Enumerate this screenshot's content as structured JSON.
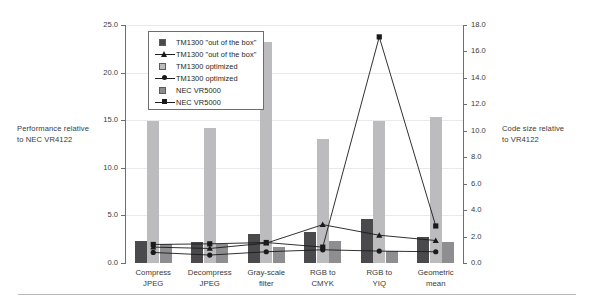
{
  "chart_data": {
    "type": "bar",
    "title": "",
    "subtitle": "",
    "categories": [
      "Compress JPEG",
      "Decompress JPEG",
      "Gray-scale filter",
      "RGB to CMYK",
      "RGB to YIQ",
      "Geometric mean"
    ],
    "category_lines": [
      [
        "Compress",
        "JPEG"
      ],
      [
        "Decompress",
        "JPEG"
      ],
      [
        "Gray-scale",
        "filter"
      ],
      [
        "RGB to",
        "CMYK"
      ],
      [
        "RGB to",
        "YIQ"
      ],
      [
        "Geometric",
        "mean"
      ]
    ],
    "xlabel": "",
    "ylabel": "Performance relative to NEC VR4122",
    "y2label": "Code size relative to VR4122",
    "ylim": [
      0.0,
      25.0
    ],
    "y2lim": [
      0.0,
      18.0
    ],
    "yticks": [
      "0.0",
      "5.0",
      "10.0",
      "15.0",
      "20.0",
      "25.0"
    ],
    "ytick_values": [
      0.0,
      5.0,
      10.0,
      15.0,
      20.0,
      25.0
    ],
    "y2ticks": [
      "0.0",
      "2.0",
      "4.0",
      "6.0",
      "8.0",
      "10.0",
      "12.0",
      "14.0",
      "16.0",
      "18.0"
    ],
    "y2tick_values": [
      0.0,
      2.0,
      4.0,
      6.0,
      8.0,
      10.0,
      12.0,
      14.0,
      16.0,
      18.0
    ],
    "grid": true,
    "legend_position": "upper-left-inside",
    "bar_series": [
      {
        "name": "TM1300 \"out of the box\"",
        "axis": "left",
        "color": "#4a4a4d",
        "marker": "square-swatch",
        "values": [
          2.3,
          2.2,
          3.0,
          3.3,
          4.6,
          2.7
        ]
      },
      {
        "name": "TM1300 optimized",
        "axis": "left",
        "color": "#bcbcbe",
        "marker": "square-swatch",
        "values": [
          14.9,
          14.2,
          23.2,
          13.0,
          14.9,
          15.3
        ]
      },
      {
        "name": "NEC VR5000",
        "axis": "left",
        "color": "#8e8e91",
        "marker": "square-swatch",
        "values": [
          2.0,
          2.0,
          1.7,
          2.3,
          1.3,
          2.2
        ]
      }
    ],
    "line_series": [
      {
        "name": "TM1300 \"out of the box\"",
        "axis": "right",
        "color": "#1a1a1a",
        "marker": "triangle",
        "values": [
          1.2,
          1.1,
          1.5,
          2.9,
          2.1,
          1.7
        ]
      },
      {
        "name": "TM1300 optimized",
        "axis": "right",
        "color": "#1a1a1a",
        "marker": "circle",
        "values": [
          0.8,
          0.6,
          0.85,
          1.0,
          0.9,
          0.85
        ]
      },
      {
        "name": "NEC VR5000",
        "axis": "right",
        "color": "#1a1a1a",
        "marker": "square",
        "values": [
          1.4,
          1.45,
          1.55,
          1.2,
          17.1,
          2.8
        ]
      }
    ]
  },
  "axis_titles": {
    "left_line1": "Performance relative",
    "left_line2": "to NEC VR4122",
    "right_line1": "Code size relative",
    "right_line2": "to VR4122"
  },
  "legend": {
    "items": [
      {
        "label": "TM1300 \"out of the box\"",
        "marker": "swatch-dark"
      },
      {
        "label": "TM1300 \"out of the box\"",
        "marker": "line-triangle"
      },
      {
        "label": "TM1300 optimized",
        "marker": "swatch-light"
      },
      {
        "label": "TM1300 optimized",
        "marker": "line-circle"
      },
      {
        "label": "NEC VR5000",
        "marker": "swatch-mid"
      },
      {
        "label": "NEC VR5000",
        "marker": "line-square"
      }
    ]
  },
  "colors": {
    "bar_dark": "#4a4a4d",
    "bar_light": "#bcbcbe",
    "bar_mid": "#8e8e91",
    "line": "#1a1a1a",
    "axis": "#6e6e72",
    "grid": "#e9e9ec",
    "text": "#3a3a3a",
    "background": "#ffffff"
  }
}
